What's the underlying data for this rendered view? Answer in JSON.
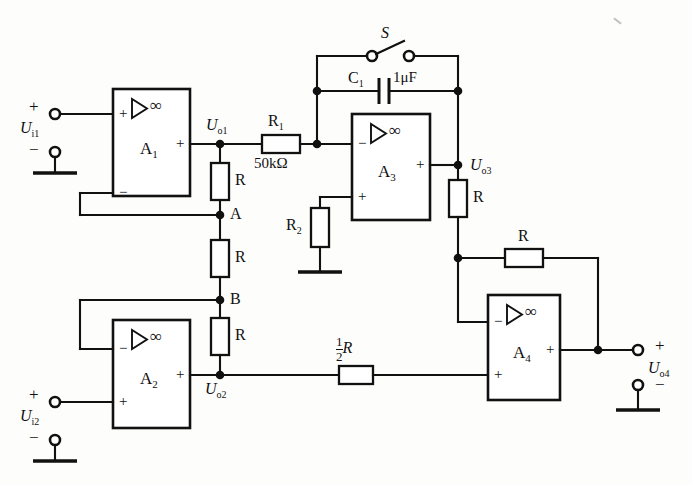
{
  "diagram": {
    "type": "schematic",
    "infinity_symbol": "∞",
    "triangle_icon": "amplifier-triangle-icon"
  },
  "amplifiers": [
    {
      "id": "A1",
      "name": "A",
      "sub": "1",
      "minus": "−",
      "plus": "+",
      "inv_pin": "−",
      "noninv_pin": "+",
      "out_pin": "+"
    },
    {
      "id": "A2",
      "name": "A",
      "sub": "2",
      "minus": "−",
      "plus": "+",
      "inv_pin": "−",
      "noninv_pin": "+",
      "out_pin": "+"
    },
    {
      "id": "A3",
      "name": "A",
      "sub": "3",
      "minus": "−",
      "plus": "+",
      "inv_pin": "−",
      "noninv_pin": "+",
      "out_pin": "+"
    },
    {
      "id": "A4",
      "name": "A",
      "sub": "4",
      "minus": "−",
      "plus": "+",
      "inv_pin": "−",
      "noninv_pin": "+",
      "out_pin": "+"
    }
  ],
  "signals": {
    "ui1": {
      "letter": "U",
      "sub": "i1",
      "plus": "+",
      "minus": "−"
    },
    "ui2": {
      "letter": "U",
      "sub": "i2",
      "plus": "+",
      "minus": "−"
    },
    "uo1": {
      "letter": "U",
      "sub": "o1"
    },
    "uo2": {
      "letter": "U",
      "sub": "o2"
    },
    "uo3": {
      "letter": "U",
      "sub": "o3"
    },
    "uo4": {
      "letter": "U",
      "sub": "o4",
      "plus": "+",
      "minus": "−"
    }
  },
  "nodes": {
    "a": "A",
    "b": "B"
  },
  "components": {
    "r1": {
      "label": "R",
      "sub": "1",
      "value": "50kΩ"
    },
    "r2": {
      "label": "R",
      "sub": "2",
      "value": ""
    },
    "c1": {
      "label": "C",
      "sub": "1",
      "value": "1μF"
    },
    "switch": {
      "label": "S"
    },
    "r_gain_top": {
      "label": "R"
    },
    "r_gain_mid": {
      "label": "R"
    },
    "r_gain_bot": {
      "label": "R"
    },
    "r_fb_vert": {
      "label": "R"
    },
    "r_fb_horz": {
      "label": "R"
    },
    "r_half": {
      "num": "1",
      "den": "2",
      "label": "R"
    }
  },
  "colors": {
    "wire": "#111111",
    "background": "#fdfdfb",
    "fill": "#ffffff"
  }
}
